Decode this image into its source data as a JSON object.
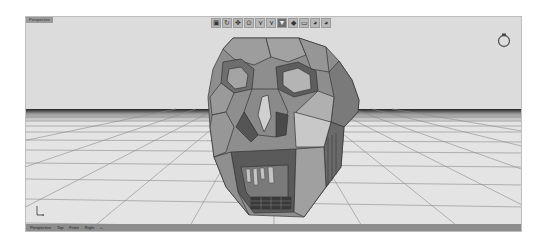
{
  "viewport": {
    "title": "Perspective",
    "background": "#d9d9d9",
    "floor_color": "#e6e6e6",
    "grid_color": "#8a8a8a",
    "horizon_color": "#2a2a2a"
  },
  "toolbar": {
    "buttons": [
      {
        "name": "shade-mode",
        "glyph": "▣"
      },
      {
        "name": "rotate-view",
        "glyph": "↻"
      },
      {
        "name": "pan-view",
        "glyph": "✥"
      },
      {
        "name": "zoom-view",
        "glyph": "⊙"
      },
      {
        "name": "select-vertex",
        "glyph": "⋎"
      },
      {
        "name": "select-edge",
        "glyph": "⋎"
      },
      {
        "name": "select-face",
        "glyph": "▼"
      },
      {
        "name": "select-object",
        "glyph": "◆"
      },
      {
        "name": "frame-view",
        "glyph": "▭"
      },
      {
        "name": "render-preview",
        "glyph": "◕"
      },
      {
        "name": "material-sphere",
        "glyph": "◕"
      }
    ]
  },
  "bottom_tabs": [
    {
      "label": "Perspective"
    },
    {
      "label": "Top"
    },
    {
      "label": "Front"
    },
    {
      "label": "Right"
    },
    {
      "label": "+"
    }
  ],
  "axis": {
    "x_label": "x",
    "y_label": "y"
  }
}
